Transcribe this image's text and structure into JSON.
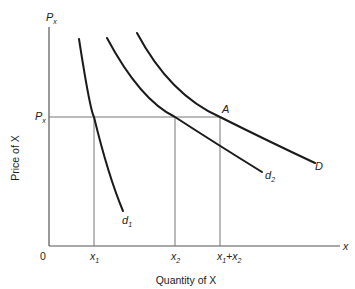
{
  "diagram": {
    "type": "demand-curves",
    "axes": {
      "y_axis_top_label": "P",
      "y_axis_top_label_sub": "x",
      "y_axis_title": "Price of X",
      "x_axis_end_label": "x",
      "x_axis_title": "Quantity of X",
      "origin_label": "0"
    },
    "price_level": {
      "label": "P",
      "label_sub": "x"
    },
    "x_ticks": [
      {
        "label": "x",
        "sub": "1"
      },
      {
        "label": "x",
        "sub": "2"
      },
      {
        "label": "x",
        "sub": "1",
        "plus": "+",
        "label2": "x",
        "sub2": "2"
      }
    ],
    "curves": [
      {
        "name": "d",
        "sub": "1"
      },
      {
        "name": "d",
        "sub": "2"
      },
      {
        "name": "D"
      }
    ],
    "point_label": "A",
    "colors": {
      "curve": "#1a1a1a",
      "axis": "#555555",
      "guide": "#777777",
      "text": "#222222"
    }
  }
}
